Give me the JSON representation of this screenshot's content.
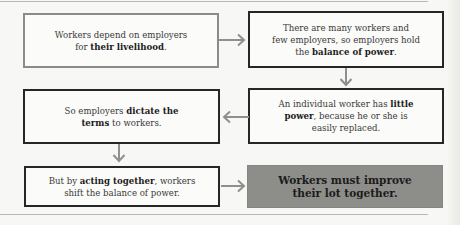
{
  "diagram": {
    "type": "flowchart",
    "boxes": [
      {
        "id": "box1",
        "line1": "Workers depend on employers",
        "pre2": "for ",
        "bold2": "their livelihood",
        "post2": ".",
        "style": "gray-border"
      },
      {
        "id": "box2",
        "line1": "There are many workers and",
        "line2": "few employers, so employers hold",
        "pre3": "the ",
        "bold3": "balance of power",
        "post3": ".",
        "style": "dark-border"
      },
      {
        "id": "box3",
        "pre1": "An individual worker has ",
        "bold1": "little",
        "bold2": "power",
        "post2": ", because he or she is",
        "line3": "easily replaced.",
        "style": "dark-border"
      },
      {
        "id": "box4",
        "pre1": "So employers ",
        "bold1": "dictate the",
        "bold2": "terms",
        "post2": " to workers.",
        "style": "dark-border"
      },
      {
        "id": "box5",
        "pre1": "But by ",
        "bold1": "acting together",
        "post1": ", workers",
        "line2": "shift the balance of power.",
        "style": "dark-border"
      },
      {
        "id": "box6",
        "line1": "Workers must improve",
        "line2": "their lot together.",
        "style": "gray-filled"
      }
    ],
    "connections": [
      {
        "from": "box1",
        "to": "box2",
        "direction": "right"
      },
      {
        "from": "box2",
        "to": "box3",
        "direction": "down"
      },
      {
        "from": "box3",
        "to": "box4",
        "direction": "left"
      },
      {
        "from": "box4",
        "to": "box5",
        "direction": "down"
      },
      {
        "from": "box5",
        "to": "box6",
        "direction": "right"
      }
    ],
    "colors": {
      "gray_border": "#8b8b88",
      "dark_border": "#262626",
      "filled_box": "#8d8d8a",
      "arrow": "#8f8f8c",
      "background": "#f7f7f5"
    }
  }
}
